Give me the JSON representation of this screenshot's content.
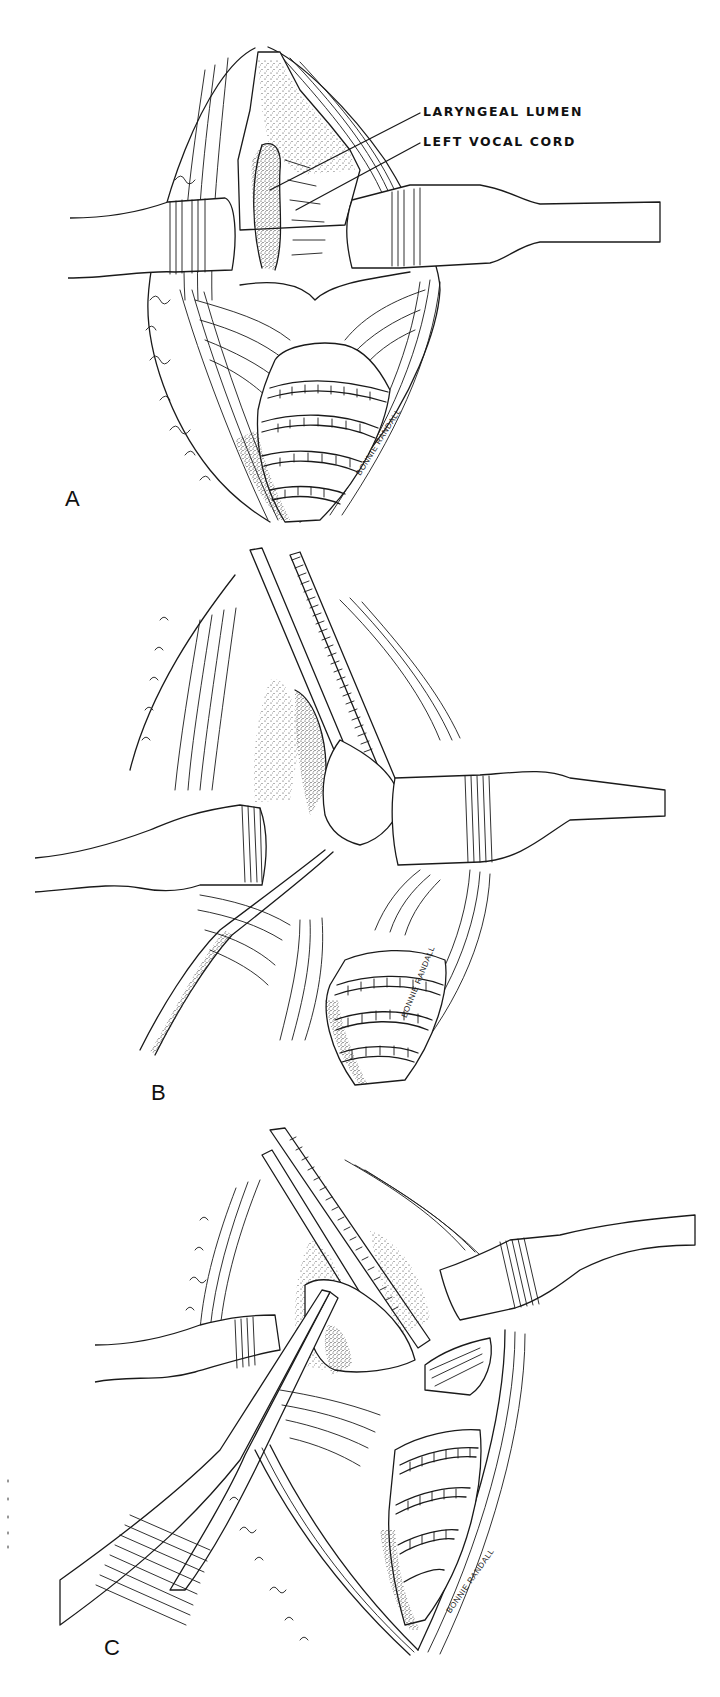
{
  "figure": {
    "panels": [
      {
        "letter": "A",
        "callouts": [
          {
            "text": "LARYNGEAL LUMEN"
          },
          {
            "text": "LEFT VOCAL CORD"
          }
        ],
        "signature": "BONNIE RANDALL"
      },
      {
        "letter": "B",
        "signature": "BONNIE RANDALL"
      },
      {
        "letter": "C",
        "signature": "BONNIE RANDALL"
      }
    ]
  },
  "colors": {
    "ink": "#1a1a1a",
    "paper": "#ffffff"
  }
}
